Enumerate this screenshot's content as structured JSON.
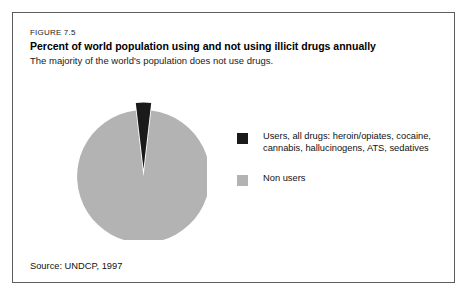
{
  "figure": {
    "label": "FIGURE 7.5",
    "title": "Percent of world population using and not using illicit drugs annually",
    "subtitle": "The majority of the world's population does not use drugs.",
    "source": "Source: UNDCP, 1997"
  },
  "colors": {
    "users": "#1a1a1a",
    "non_users": "#b3b3b3",
    "frame_border": "#5d5d5d",
    "text": "#111111",
    "background": "#ffffff"
  },
  "legend": {
    "position": "right",
    "items": [
      {
        "key": "users",
        "swatch_color": "#1a1a1a",
        "label": "Users, all drugs: heroin/opiates, cocaine, cannabis, hallucinogens, ATS, sedatives"
      },
      {
        "key": "non_users",
        "swatch_color": "#b3b3b3",
        "label": "Non users"
      }
    ]
  },
  "chart_data": {
    "type": "pie",
    "title": "Percent of world population using and not using illicit drugs annually",
    "subtitle": "The majority of the world's population does not use drugs.",
    "xlabel": "",
    "ylabel": "",
    "unit": "percent",
    "grid": false,
    "legend_position": "right",
    "start_angle_deg": -90,
    "direction": "clockwise",
    "exploded_slice": "Users, all drugs",
    "labels": [
      "Users, all drugs: heroin/opiates, cocaine, cannabis, hallucinogens, ATS, sedatives",
      "Non users"
    ],
    "categories": [
      "Users, all drugs",
      "Non users"
    ],
    "values": [
      3.7,
      96.3
    ],
    "slices": [
      {
        "name": "Users, all drugs",
        "value": 3.7,
        "angle_deg": 13.3,
        "color": "#1a1a1a",
        "exploded": true
      },
      {
        "name": "Non users",
        "value": 96.3,
        "angle_deg": 346.7,
        "color": "#b3b3b3",
        "exploded": false
      }
    ],
    "source": "Source: UNDCP, 1997"
  }
}
